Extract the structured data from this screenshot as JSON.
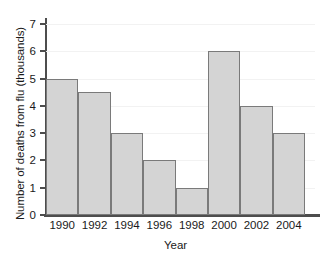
{
  "chart_data": {
    "type": "bar",
    "title": "",
    "xlabel": "Year",
    "ylabel": "Number of deaths from flu (thousands)",
    "categories": [
      "1990",
      "1992",
      "1994",
      "1996",
      "1998",
      "2000",
      "2002",
      "2004"
    ],
    "values": [
      5,
      4.5,
      3,
      2,
      1,
      6,
      4,
      3
    ],
    "ylim": [
      0,
      7
    ],
    "yticks": [
      "0",
      "1",
      "2",
      "3",
      "4",
      "5",
      "6",
      "7"
    ],
    "ytick_values": [
      0,
      1,
      2,
      3,
      4,
      5,
      6,
      7
    ],
    "grid": "horizontal",
    "legend": "none",
    "bar_fill_color": "#d4d4d4",
    "bar_edge_color": "#7a7a7a",
    "axis_color": "#4d4d4d",
    "gridline_color": "#f2f2f2",
    "background_color": "#ffffff"
  }
}
